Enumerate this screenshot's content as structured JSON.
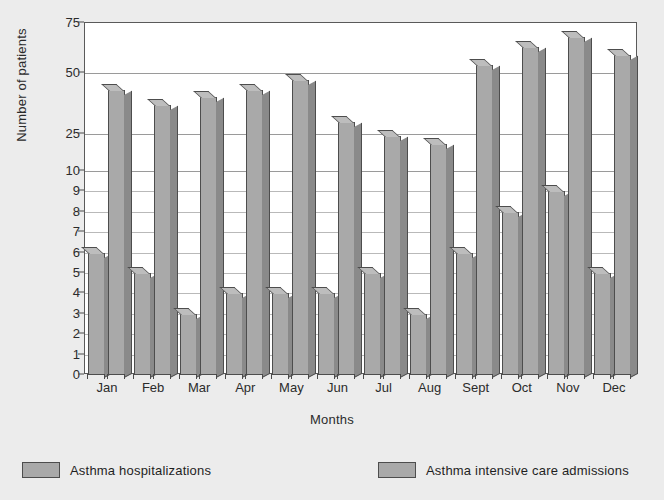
{
  "chart_data": {
    "type": "bar",
    "title": "",
    "xlabel": "Months",
    "ylabel": "Number of patients",
    "categories": [
      "Jan",
      "Feb",
      "Mar",
      "Apr",
      "May",
      "Jun",
      "Jul",
      "Aug",
      "Sept",
      "Oct",
      "Nov",
      "Dec"
    ],
    "series": [
      {
        "name": "Asthma hospitalizations",
        "color": "#a9a9a9",
        "values": [
          6,
          5,
          3,
          4,
          4,
          4,
          5,
          3,
          6,
          8,
          9,
          5
        ]
      },
      {
        "name": "Asthma intensive care admissions",
        "color": "#a9a9a9",
        "values": [
          43,
          37,
          40,
          43,
          47,
          30,
          24,
          21,
          54,
          63,
          68,
          59
        ]
      }
    ],
    "y_ticks": [
      0,
      1,
      2,
      3,
      4,
      5,
      6,
      7,
      8,
      9,
      10,
      25,
      50,
      75
    ],
    "y_axis_scale": "piecewise (linear 0-10, compressed 10-75)",
    "ylim": [
      0,
      75
    ],
    "grid": true,
    "legend_position": "bottom"
  },
  "legend": {
    "entries": [
      {
        "label": "Asthma hospitalizations"
      },
      {
        "label": "Asthma intensive care admissions"
      }
    ]
  },
  "colors": {
    "background": "#ececec",
    "plot_background": "#ffffff",
    "bar_face": "#a9a9a9",
    "bar_side": "#8a8a8a",
    "bar_top": "#bdbdbd",
    "axis": "#4d4d4d",
    "gridline": "#9a9a9a",
    "text": "#2b2b2b"
  }
}
